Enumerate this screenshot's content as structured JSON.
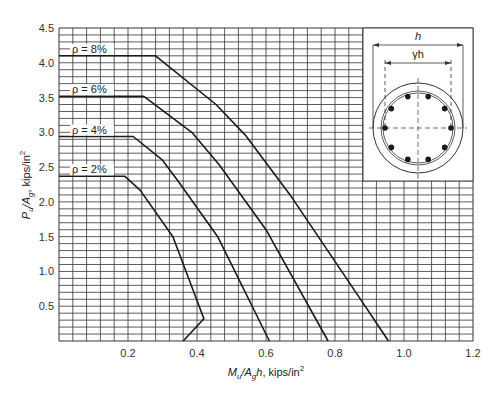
{
  "chart_data": {
    "type": "line",
    "title": "",
    "xlabel": "M_u/A_g h, kips/in^2",
    "ylabel": "P_u/A_g, kips/in^2",
    "xlim": [
      0,
      1.2
    ],
    "ylim": [
      0,
      4.5
    ],
    "x_ticks": [
      "0.2",
      "0.4",
      "0.6",
      "0.8",
      "1.0",
      "1.2"
    ],
    "y_ticks": [
      "0.5",
      "1.0",
      "1.5",
      "2.0",
      "2.5",
      "3.0",
      "3.5",
      "4.0",
      "4.5"
    ],
    "grid": true,
    "grid_x_step": 0.04,
    "grid_y_step": 0.1,
    "legend_position": "inline labels at left",
    "series": [
      {
        "name": "ρ = 8%",
        "label": "ρ = 8%",
        "points": [
          [
            0,
            4.1
          ],
          [
            0.28,
            4.1
          ],
          [
            0.455,
            3.4
          ],
          [
            0.54,
            2.96
          ],
          [
            0.67,
            2.1
          ],
          [
            0.84,
            0.85
          ],
          [
            0.955,
            0
          ]
        ]
      },
      {
        "name": "ρ = 6%",
        "label": "ρ = 6%",
        "points": [
          [
            0,
            3.52
          ],
          [
            0.245,
            3.52
          ],
          [
            0.385,
            3.0
          ],
          [
            0.465,
            2.53
          ],
          [
            0.6,
            1.6
          ],
          [
            0.78,
            0
          ]
        ]
      },
      {
        "name": "ρ = 4%",
        "label": "ρ = 4%",
        "points": [
          [
            0,
            2.94
          ],
          [
            0.215,
            2.94
          ],
          [
            0.3,
            2.6
          ],
          [
            0.345,
            2.3
          ],
          [
            0.46,
            1.5
          ],
          [
            0.61,
            0
          ]
        ]
      },
      {
        "name": "ρ = 2%",
        "label": "ρ = 2%",
        "points": [
          [
            0,
            2.37
          ],
          [
            0.19,
            2.37
          ],
          [
            0.235,
            2.17
          ],
          [
            0.33,
            1.5
          ],
          [
            0.42,
            0.32
          ],
          [
            0.36,
            0
          ]
        ]
      }
    ],
    "annotations": {
      "inset": "Circular column cross-section with 10 longitudinal bars",
      "dimension_outer": "h",
      "dimension_inner": "γh"
    }
  },
  "axes": {
    "xlabel_main": "M",
    "xlabel_sub1": "u",
    "xlabel_mid": "/A",
    "xlabel_sub2": "g",
    "xlabel_h": "h",
    "xlabel_units": ", kips/in",
    "xlabel_sup": "2",
    "ylabel_main": "P",
    "ylabel_sub1": "u",
    "ylabel_mid": "/A",
    "ylabel_sub2": "g",
    "ylabel_units": ", kips/in",
    "ylabel_sup": "2"
  },
  "inset": {
    "h_label": "h",
    "gamma_h_label": "γh",
    "bar_count": 10
  },
  "colors": {
    "grid": "#333333",
    "curve": "#1a1a1a",
    "background": "#ffffff"
  }
}
